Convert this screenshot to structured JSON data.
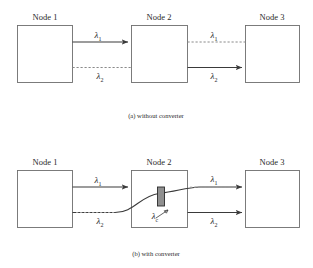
{
  "figure": {
    "panels": [
      {
        "id": "panel-a",
        "caption": "(a) without converter",
        "nodes": [
          {
            "label": "Node 1"
          },
          {
            "label": "Node 2"
          },
          {
            "label": "Node 3"
          }
        ],
        "links": [
          {
            "label": "λ",
            "subscript": "1",
            "style": "solid",
            "segment": "node1-node2"
          },
          {
            "label": "λ",
            "subscript": "2",
            "style": "dashed",
            "segment": "node1-node2"
          },
          {
            "label": "λ",
            "subscript": "1",
            "style": "dashed",
            "segment": "node2-node3"
          },
          {
            "label": "λ",
            "subscript": "2",
            "style": "solid",
            "segment": "node2-node3"
          }
        ]
      },
      {
        "id": "panel-b",
        "caption": "(b) with converter",
        "nodes": [
          {
            "label": "Node 1"
          },
          {
            "label": "Node 2"
          },
          {
            "label": "Node 3"
          }
        ],
        "links": [
          {
            "label": "λ",
            "subscript": "1",
            "style": "solid",
            "segment": "node1-node2"
          },
          {
            "label": "λ",
            "subscript": "2",
            "style": "solid",
            "segment": "node1-node2"
          },
          {
            "label": "λ",
            "subscript": "1",
            "style": "solid",
            "segment": "node2-node3"
          },
          {
            "label": "λ",
            "subscript": "2",
            "style": "solid",
            "segment": "node2-node3"
          }
        ],
        "converter": {
          "label": "λ",
          "subscript": "c"
        }
      }
    ],
    "colors": {
      "background": "#ffffff",
      "node_border": "#6e6e6e",
      "solid_link": "#3a3a3a",
      "dashed_link": "#8a8a8a",
      "converter_fill": "#8f8f8f",
      "text": "#2b2b2b"
    }
  }
}
